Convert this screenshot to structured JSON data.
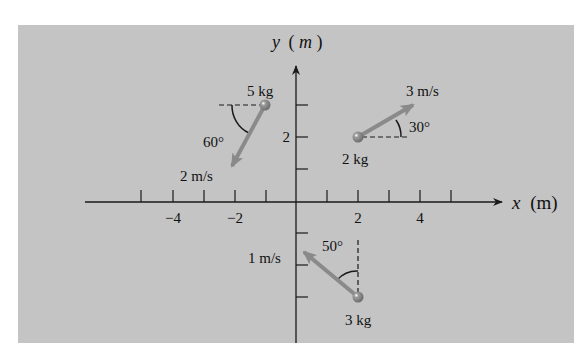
{
  "diagram": {
    "colors": {
      "background_panel": "#c4c4c4",
      "axis": "#1a1a1a",
      "velocity_arrow": "#8a8a8a",
      "particle": "#7a7a7a"
    },
    "axes": {
      "x_label_var": "x",
      "x_label_unit": "(m)",
      "y_label_var": "y",
      "y_label_unit_open": "(",
      "y_label_unit": "m",
      "y_label_unit_close": ")",
      "x_tick_labels": [
        "−4",
        "−2",
        "2",
        "4"
      ],
      "y_tick_labels": [
        "2"
      ],
      "x_ticks": [
        -5,
        -4,
        -3,
        -2,
        -1,
        1,
        2,
        3,
        4,
        5
      ],
      "y_ticks": [
        3,
        2,
        1,
        -1,
        -2,
        -3
      ]
    },
    "particles": [
      {
        "id": "p5",
        "mass_label": "5 kg",
        "position": [
          -1,
          3
        ],
        "speed_label": "2 m/s",
        "angle_label": "60°",
        "direction": "60° below −x axis"
      },
      {
        "id": "p2",
        "mass_label": "2 kg",
        "position": [
          2,
          2
        ],
        "speed_label": "3 m/s",
        "angle_label": "30°",
        "direction": "30° above +x axis"
      },
      {
        "id": "p3",
        "mass_label": "3 kg",
        "position": [
          2,
          -3
        ],
        "speed_label": "1 m/s",
        "angle_label": "50°",
        "direction": "50° from +y axis toward −x"
      }
    ]
  }
}
